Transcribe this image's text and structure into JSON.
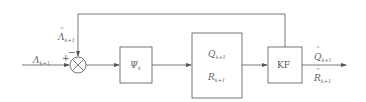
{
  "diagram": {
    "input": {
      "symbol": "Λ",
      "subscript": "k+1"
    },
    "feedback": {
      "symbol": "Λ",
      "hat": "^",
      "subscript": "k+1"
    },
    "summing_junction": {
      "plus_sign": "+",
      "minus_sign": "−"
    },
    "blocks": [
      {
        "id": "psi",
        "symbol": "Ψ",
        "subscript": "k"
      },
      {
        "id": "qr",
        "lines": [
          {
            "symbol": "Q",
            "subscript": "k+1"
          },
          {
            "symbol": "R",
            "subscript": "k+1"
          }
        ]
      },
      {
        "id": "kf",
        "label": "KF"
      }
    ],
    "outputs": [
      {
        "symbol": "Q",
        "hat": "^",
        "subscript": "k+1"
      },
      {
        "symbol": "R",
        "hat": "^",
        "subscript": "k+1"
      }
    ],
    "colors": {
      "line": "#555555",
      "text": "#666666",
      "background": "#ffffff"
    }
  }
}
